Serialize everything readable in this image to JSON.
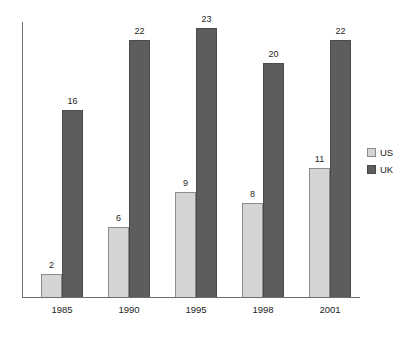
{
  "chart_data": {
    "type": "bar",
    "title": "",
    "subtitle": "",
    "xlabel": "",
    "ylabel": "",
    "categories": [
      "1985",
      "1990",
      "1995",
      "1998",
      "2001"
    ],
    "series": [
      {
        "name": "US",
        "color": "#d5d5d5",
        "values": [
          2,
          6,
          9,
          8,
          11
        ]
      },
      {
        "name": "UK",
        "color": "#5d5d5d",
        "values": [
          16,
          22,
          23,
          20,
          22
        ]
      }
    ],
    "value_labels_shown": true,
    "ylim": [
      0,
      23.5
    ],
    "grid": false,
    "legend_position": "right",
    "axes": {
      "y_axis_visible": true,
      "x_axis_visible": true,
      "y_ticks": []
    }
  },
  "legend": {
    "entries": [
      {
        "label": "US",
        "swatch": "legend-swatch-us"
      },
      {
        "label": "UK",
        "swatch": "legend-swatch-uk"
      }
    ]
  },
  "colors": {
    "us_fill": "#d5d5d5",
    "us_stroke": "#8c8c8c",
    "uk_fill": "#5d5d5d",
    "uk_stroke": "#4a4a4a",
    "axis": "#6e6e6e",
    "text": "#1d1d1d",
    "background": "#ffffff"
  }
}
